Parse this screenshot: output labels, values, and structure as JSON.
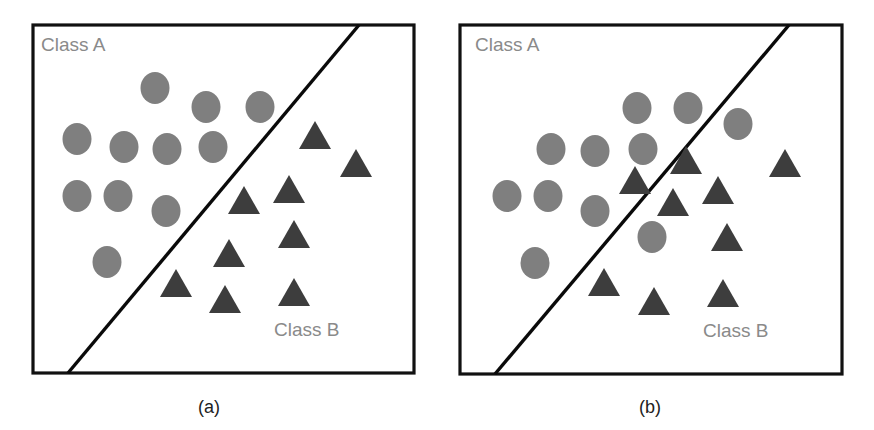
{
  "colors": {
    "frame": "#111111",
    "boundary": "#0a0a0a",
    "class_a_marker": "#7f7f7f",
    "class_b_marker": "#3d3d3d",
    "class_label": "#8a8a8a",
    "caption": "#222222"
  },
  "panels": [
    {
      "id": "a",
      "caption": "(a)",
      "class_a_label": "Class A",
      "class_b_label": "Class B",
      "frame": {
        "x": 33,
        "y": 25,
        "w": 381,
        "h": 348
      },
      "boundary": {
        "x1": 359,
        "y1": 25,
        "x2": 68,
        "y2": 373
      },
      "class_a_points": [
        [
          155,
          88
        ],
        [
          206,
          107
        ],
        [
          260,
          107
        ],
        [
          77,
          139
        ],
        [
          124,
          147
        ],
        [
          167,
          149
        ],
        [
          213,
          147
        ],
        [
          77,
          196
        ],
        [
          118,
          196
        ],
        [
          166,
          211
        ],
        [
          107,
          262
        ]
      ],
      "class_b_points": [
        [
          315,
          135
        ],
        [
          356,
          163
        ],
        [
          289,
          189
        ],
        [
          244,
          200
        ],
        [
          229,
          253
        ],
        [
          294,
          234
        ],
        [
          176,
          283
        ],
        [
          225,
          299
        ],
        [
          294,
          292
        ]
      ]
    },
    {
      "id": "b",
      "caption": "(b)",
      "class_a_label": "Class A",
      "class_b_label": "Class B",
      "frame": {
        "x": 460,
        "y": 25,
        "w": 382,
        "h": 349
      },
      "boundary": {
        "x1": 789,
        "y1": 25,
        "x2": 495,
        "y2": 374
      },
      "class_a_points": [
        [
          637,
          108
        ],
        [
          688,
          108
        ],
        [
          738,
          124
        ],
        [
          551,
          149
        ],
        [
          595,
          151
        ],
        [
          643,
          149
        ],
        [
          507,
          196
        ],
        [
          548,
          196
        ],
        [
          595,
          211
        ],
        [
          652,
          237
        ],
        [
          535,
          263
        ]
      ],
      "class_b_points": [
        [
          686,
          160
        ],
        [
          635,
          180
        ],
        [
          785,
          163
        ],
        [
          673,
          202
        ],
        [
          718,
          190
        ],
        [
          727,
          237
        ],
        [
          604,
          282
        ],
        [
          654,
          301
        ],
        [
          723,
          293
        ]
      ]
    }
  ]
}
